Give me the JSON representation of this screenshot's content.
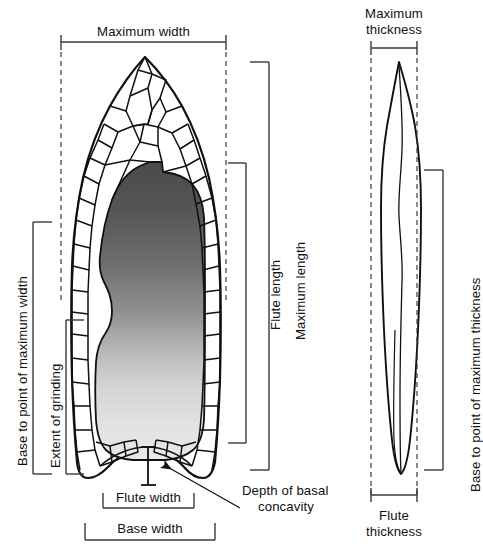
{
  "figure": {
    "views": [
      {
        "name": "face-view",
        "label": ""
      },
      {
        "name": "profile-view",
        "label": ""
      }
    ],
    "ink_color": "#111111",
    "line_color": "#3a3a3a",
    "flute_gradient_dark": "#4a4a4a",
    "flute_gradient_light": "#e8e8e8"
  },
  "labels": {
    "maximum_width": "Maximum width",
    "maximum_length": "Maximum length",
    "flute_length": "Flute length",
    "base_to_point_of_maximum_width": "Base to point of maximum width",
    "extent_of_grinding": "Extent of grinding",
    "flute_width": "Flute width",
    "base_width": "Base width",
    "depth_of_basal_concavity_line1": "Depth of basal",
    "depth_of_basal_concavity_line2": "concavity",
    "maximum_thickness_line1": "Maximum",
    "maximum_thickness_line2": "thickness",
    "base_to_point_of_maximum_thickness": "Base to point of maximum thickness",
    "flute_thickness_line1": "Flute",
    "flute_thickness_line2": "thickness"
  },
  "measurements": [
    {
      "id": "maximum-width",
      "view": "face",
      "orientation": "horizontal",
      "label": "Maximum width"
    },
    {
      "id": "maximum-length",
      "view": "face",
      "orientation": "vertical",
      "label": "Maximum length"
    },
    {
      "id": "flute-length",
      "view": "face",
      "orientation": "vertical",
      "label": "Flute length"
    },
    {
      "id": "base-to-point-of-maximum-width",
      "view": "face",
      "orientation": "vertical",
      "label": "Base to point of maximum width"
    },
    {
      "id": "extent-of-grinding",
      "view": "face",
      "orientation": "vertical",
      "label": "Extent of grinding"
    },
    {
      "id": "flute-width",
      "view": "face",
      "orientation": "horizontal",
      "label": "Flute width"
    },
    {
      "id": "base-width",
      "view": "face",
      "orientation": "horizontal",
      "label": "Base width"
    },
    {
      "id": "depth-of-basal-concavity",
      "view": "face",
      "orientation": "vertical",
      "label": "Depth of basal concavity"
    },
    {
      "id": "maximum-thickness",
      "view": "profile",
      "orientation": "horizontal",
      "label": "Maximum thickness"
    },
    {
      "id": "base-to-point-of-maximum-thickness",
      "view": "profile",
      "orientation": "vertical",
      "label": "Base to point of maximum thickness"
    },
    {
      "id": "flute-thickness",
      "view": "profile",
      "orientation": "horizontal",
      "label": "Flute thickness"
    }
  ]
}
